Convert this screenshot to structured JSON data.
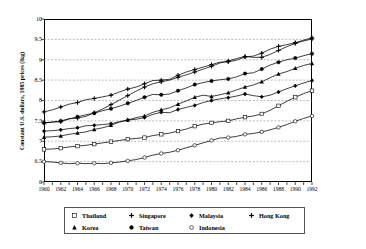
{
  "chart_data": {
    "type": "line",
    "title": "",
    "xlabel": "",
    "ylabel": "Constant U.S. dollars, 1985 prices (lkg)",
    "xlim": [
      1960,
      1992
    ],
    "ylim": [
      6,
      10
    ],
    "ytick_labels": [
      "10",
      "9.5",
      "9",
      "8.5",
      "8",
      "7.5",
      "7",
      "6.5",
      "6"
    ],
    "ytick_values": [
      10,
      9.5,
      9,
      8.5,
      8,
      7.5,
      7,
      6.5,
      6
    ],
    "x": [
      1960,
      1961,
      1962,
      1963,
      1964,
      1965,
      1966,
      1967,
      1968,
      1969,
      1970,
      1971,
      1972,
      1973,
      1974,
      1975,
      1976,
      1977,
      1978,
      1979,
      1980,
      1981,
      1982,
      1983,
      1984,
      1985,
      1986,
      1987,
      1988,
      1989,
      1990,
      1991,
      1992
    ],
    "xtick_labels": [
      "1960",
      "1962",
      "1964",
      "1966",
      "1968",
      "1970",
      "1972",
      "1974",
      "1976",
      "1978",
      "1980",
      "1982",
      "1984",
      "1986",
      "1988",
      "1990",
      "1992"
    ],
    "xtick_values": [
      1960,
      1962,
      1964,
      1966,
      1968,
      1970,
      1972,
      1974,
      1976,
      1978,
      1980,
      1982,
      1984,
      1986,
      1988,
      1990,
      1992
    ],
    "grid": "horizontal-dashed",
    "legend_position": "below-plot",
    "series": [
      {
        "name": "Thailand",
        "marker": "open-square",
        "values": [
          6.8,
          6.81,
          6.83,
          6.86,
          6.88,
          6.9,
          6.93,
          6.96,
          6.99,
          7.02,
          7.05,
          7.07,
          7.09,
          7.14,
          7.17,
          7.2,
          7.25,
          7.3,
          7.37,
          7.42,
          7.45,
          7.48,
          7.5,
          7.55,
          7.59,
          7.62,
          7.67,
          7.76,
          7.87,
          7.98,
          8.08,
          8.17,
          8.24
        ]
      },
      {
        "name": "Singapore",
        "marker": "filled-plus",
        "values": [
          7.45,
          7.47,
          7.48,
          7.55,
          7.57,
          7.61,
          7.7,
          7.79,
          7.9,
          8.01,
          8.12,
          8.23,
          8.33,
          8.41,
          8.46,
          8.5,
          8.57,
          8.63,
          8.7,
          8.77,
          8.84,
          8.92,
          8.97,
          9.03,
          9.08,
          9.06,
          9.06,
          9.13,
          9.23,
          9.32,
          9.4,
          9.46,
          9.51
        ]
      },
      {
        "name": "Malaysia",
        "marker": "filled-diamond",
        "values": [
          7.25,
          7.26,
          7.28,
          7.31,
          7.33,
          7.38,
          7.39,
          7.41,
          7.43,
          7.48,
          7.52,
          7.54,
          7.58,
          7.66,
          7.71,
          7.7,
          7.78,
          7.83,
          7.88,
          7.95,
          8.0,
          8.04,
          8.07,
          8.11,
          8.16,
          8.12,
          8.09,
          8.13,
          8.21,
          8.29,
          8.36,
          8.43,
          8.49
        ]
      },
      {
        "name": "Hong Kong",
        "marker": "filled-plus",
        "values": [
          7.72,
          7.77,
          7.84,
          7.91,
          7.95,
          8.02,
          8.05,
          8.09,
          8.13,
          8.21,
          8.28,
          8.33,
          8.41,
          8.49,
          8.5,
          8.52,
          8.62,
          8.7,
          8.76,
          8.82,
          8.88,
          8.94,
          8.95,
          8.99,
          9.07,
          9.09,
          9.16,
          9.26,
          9.33,
          9.37,
          9.42,
          9.48,
          9.54
        ]
      },
      {
        "name": "Korea",
        "marker": "filled-triangle",
        "values": [
          7.1,
          7.11,
          7.13,
          7.17,
          7.2,
          7.23,
          7.29,
          7.33,
          7.39,
          7.47,
          7.52,
          7.58,
          7.62,
          7.71,
          7.77,
          7.82,
          7.91,
          7.99,
          8.08,
          8.13,
          8.1,
          8.14,
          8.19,
          8.26,
          8.33,
          8.38,
          8.46,
          8.56,
          8.65,
          8.71,
          8.79,
          8.86,
          8.91
        ]
      },
      {
        "name": "Taiwan",
        "marker": "filled-circle",
        "values": [
          7.45,
          7.47,
          7.5,
          7.55,
          7.6,
          7.65,
          7.69,
          7.75,
          7.8,
          7.86,
          7.93,
          8.0,
          8.08,
          8.15,
          8.14,
          8.16,
          8.24,
          8.31,
          8.39,
          8.44,
          8.48,
          8.51,
          8.53,
          8.58,
          8.66,
          8.68,
          8.77,
          8.87,
          8.94,
          9.0,
          9.04,
          9.1,
          9.15
        ]
      },
      {
        "name": "Indonesia",
        "marker": "open-circle",
        "values": [
          6.5,
          6.49,
          6.47,
          6.45,
          6.46,
          6.45,
          6.46,
          6.45,
          6.47,
          6.49,
          6.52,
          6.55,
          6.6,
          6.66,
          6.7,
          6.73,
          6.78,
          6.84,
          6.9,
          6.96,
          7.02,
          7.08,
          7.09,
          7.12,
          7.17,
          7.19,
          7.23,
          7.28,
          7.34,
          7.41,
          7.49,
          7.56,
          7.62
        ]
      }
    ]
  },
  "legend": {
    "row1": [
      {
        "label": "Thailand",
        "marker": "open-square"
      },
      {
        "label": "Singapore",
        "marker": "filled-plus"
      },
      {
        "label": "Malaysia",
        "marker": "filled-diamond"
      },
      {
        "label": "Hong Kong",
        "marker": "filled-plus"
      }
    ],
    "row2": [
      {
        "label": "Korea",
        "marker": "filled-triangle"
      },
      {
        "label": "Taiwan",
        "marker": "filled-circle"
      },
      {
        "label": "Indonesia",
        "marker": "open-circle"
      }
    ]
  },
  "colors": {
    "line": "#000000",
    "grid": "#777777",
    "axis": "#000000",
    "background": "#ffffff"
  }
}
